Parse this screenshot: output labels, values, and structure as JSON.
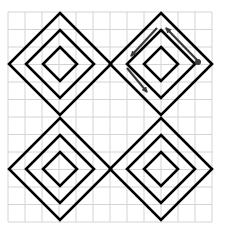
{
  "diagram": {
    "background": "#ffffff",
    "grid": {
      "x0": 8,
      "y0": 12,
      "cols": 12,
      "rows": 12,
      "cell_w": 17,
      "cell_h": 17.5,
      "color": "#d4d4d4"
    },
    "stroke_color": "#000000",
    "arrow_color": "#3a3a3a",
    "diamonds": [
      {
        "name": "top-left",
        "cx": 60,
        "cy": 64,
        "radii": [
          51,
          34,
          17
        ]
      },
      {
        "name": "top-right",
        "cx": 161,
        "cy": 64,
        "radii": [
          51,
          34,
          17
        ]
      },
      {
        "name": "bottom-left",
        "cx": 60,
        "cy": 169,
        "radii": [
          51,
          34,
          17
        ]
      },
      {
        "name": "bottom-right",
        "cx": 161,
        "cy": 169,
        "radii": [
          51,
          34,
          17
        ]
      }
    ],
    "arrows": [
      {
        "name": "arrow-upper-left",
        "x1": 157,
        "y1": 28,
        "x2": 131,
        "y2": 56
      },
      {
        "name": "arrow-lower-left",
        "x1": 127,
        "y1": 68,
        "x2": 147,
        "y2": 92
      },
      {
        "name": "arrow-upper-right-up",
        "x1": 198,
        "y1": 61,
        "x2": 166,
        "y2": 28
      }
    ],
    "dot": {
      "cx": 198,
      "cy": 62,
      "r": 3
    }
  }
}
